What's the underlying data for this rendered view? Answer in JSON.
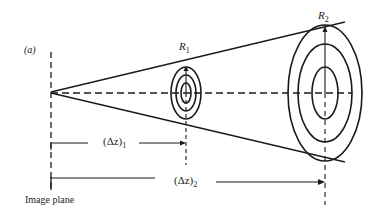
{
  "figure": {
    "panel_label": "(a)",
    "image_plane_label": "Image plane",
    "rings": [
      {
        "name": "R",
        "subscript": "1"
      },
      {
        "name": "R",
        "subscript": "2"
      }
    ],
    "distances": [
      {
        "prefix": "(Δz)",
        "subscript": "1"
      },
      {
        "prefix": "(Δz)",
        "subscript": "2"
      }
    ],
    "colors": {
      "line": "#1a1a1a",
      "text": "#222222",
      "background": "#ffffff"
    }
  }
}
